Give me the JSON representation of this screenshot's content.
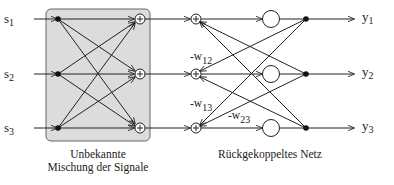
{
  "inputs": [
    {
      "name": "s",
      "sub": "1"
    },
    {
      "name": "s",
      "sub": "2"
    },
    {
      "name": "s",
      "sub": "3"
    }
  ],
  "outputs": [
    {
      "name": "y",
      "sub": "1"
    },
    {
      "name": "y",
      "sub": "2"
    },
    {
      "name": "y",
      "sub": "3"
    }
  ],
  "weights": [
    {
      "prefix": "-w",
      "sub": "12"
    },
    {
      "prefix": "-w",
      "sub": "13"
    },
    {
      "prefix": "-w",
      "sub": "23"
    }
  ],
  "captions": {
    "mixing_line1": "Unbekannte",
    "mixing_line2": "Mischung der Signale",
    "network": "Rückgekoppeltes Netz"
  },
  "colors": {
    "mixing_box_fill": "#dcdcdc",
    "stroke": "#222222"
  }
}
